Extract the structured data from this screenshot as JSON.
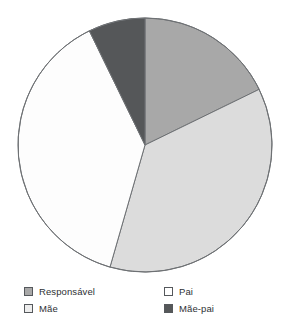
{
  "chart_data": {
    "type": "pie",
    "title": "",
    "subtitle": "",
    "xlabel": "",
    "ylabel": "",
    "legend_position": "bottom",
    "grid": false,
    "start_angle_deg": 0,
    "direction": "clockwise",
    "categories": [
      "Responsável",
      "Pai",
      "Mãe",
      "Mãe-pai"
    ],
    "values": [
      18,
      37,
      38,
      7
    ],
    "unit": "%",
    "slices": [
      {
        "label": "Responsável",
        "value": 18,
        "start_deg": 0,
        "end_deg": 64,
        "color": "#a8a8a8",
        "swatch_color": "#a8a8a8"
      },
      {
        "label": "Pai",
        "value": 37,
        "start_deg": 64,
        "end_deg": 196,
        "color": "#dcdcdc",
        "swatch_color": "#ffffff"
      },
      {
        "label": "Mãe",
        "value": 38,
        "start_deg": 196,
        "end_deg": 334,
        "color": "#fdfdfd",
        "swatch_color": "#ededed"
      },
      {
        "label": "Mãe-pai",
        "value": 7,
        "start_deg": 334,
        "end_deg": 360,
        "color": "#555759",
        "swatch_color": "#555759"
      }
    ],
    "geometry": {
      "center_x": 145,
      "center_y": 145,
      "radius": 127,
      "outline_color": "#6e7174"
    }
  },
  "legend": {
    "rows": [
      {
        "left": {
          "label": "Responsável",
          "swatch_color": "#a8a8a8"
        },
        "right": {
          "label": "Pai",
          "swatch_color": "#ffffff"
        }
      },
      {
        "left": {
          "label": "Mãe",
          "swatch_color": "#ededed"
        },
        "right": {
          "label": "Mãe-pai",
          "swatch_color": "#555759"
        }
      }
    ]
  }
}
